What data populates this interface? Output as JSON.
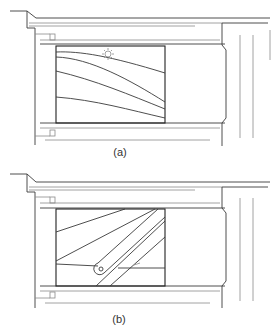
{
  "figures": [
    {
      "id": "a",
      "caption": "(a)",
      "description": "Window frame cross-section with panel showing four curved lines and a sun symbol",
      "symbols": [
        "sun-icon"
      ]
    },
    {
      "id": "b",
      "caption": "(b)",
      "description": "Window frame cross-section with panel showing diagonal straight lines and a pivot arm with circular hinge",
      "symbols": [
        "pivot-hinge-icon"
      ]
    }
  ],
  "colors": {
    "line": "#3a3a3a",
    "light_line": "#8a8a8a",
    "background": "#ffffff"
  }
}
